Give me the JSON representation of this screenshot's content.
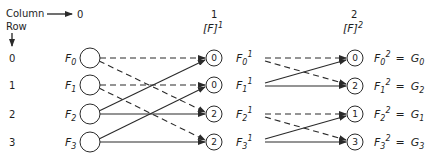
{
  "header": {
    "column_label": "Column",
    "row_label": "Row",
    "columns": [
      {
        "index": "0",
        "matrix": ""
      },
      {
        "index": "1",
        "matrix": "[F]",
        "matrix_sup": "1"
      },
      {
        "index": "2",
        "matrix": "[F]",
        "matrix_sup": "2"
      }
    ]
  },
  "rows": [
    "0",
    "1",
    "2",
    "3"
  ],
  "column0": {
    "labels": [
      {
        "base": "F",
        "sub": "0"
      },
      {
        "base": "F",
        "sub": "1"
      },
      {
        "base": "F",
        "sub": "2"
      },
      {
        "base": "F",
        "sub": "3"
      }
    ]
  },
  "column1": {
    "node_values": [
      "0",
      "0",
      "2",
      "2"
    ],
    "labels": [
      {
        "base": "F",
        "sub": "0",
        "sup": "1"
      },
      {
        "base": "F",
        "sub": "1",
        "sup": "1"
      },
      {
        "base": "F",
        "sub": "2",
        "sup": "1"
      },
      {
        "base": "F",
        "sub": "3",
        "sup": "1"
      }
    ]
  },
  "column2": {
    "node_values": [
      "0",
      "2",
      "1",
      "3"
    ],
    "labels": [
      {
        "base": "F",
        "sub": "0",
        "sup": "2",
        "eq": "=",
        "result": "G",
        "result_sub": "0"
      },
      {
        "base": "F",
        "sub": "1",
        "sup": "2",
        "eq": "=",
        "result": "G",
        "result_sub": "2"
      },
      {
        "base": "F",
        "sub": "2",
        "sup": "2",
        "eq": "=",
        "result": "G",
        "result_sub": "1"
      },
      {
        "base": "F",
        "sub": "3",
        "sup": "2",
        "eq": "=",
        "result": "G",
        "result_sub": "3"
      }
    ]
  },
  "edges": {
    "stage1": [
      {
        "from": 0,
        "to": 0,
        "style": "dashed"
      },
      {
        "from": 0,
        "to": 2,
        "style": "dashed"
      },
      {
        "from": 1,
        "to": 1,
        "style": "dashed"
      },
      {
        "from": 1,
        "to": 3,
        "style": "dashed"
      },
      {
        "from": 2,
        "to": 0,
        "style": "solid"
      },
      {
        "from": 2,
        "to": 2,
        "style": "solid"
      },
      {
        "from": 3,
        "to": 1,
        "style": "solid"
      },
      {
        "from": 3,
        "to": 3,
        "style": "solid"
      }
    ],
    "stage2": [
      {
        "from": 0,
        "to": 0,
        "style": "dashed"
      },
      {
        "from": 0,
        "to": 1,
        "style": "dashed"
      },
      {
        "from": 1,
        "to": 0,
        "style": "solid"
      },
      {
        "from": 1,
        "to": 1,
        "style": "solid"
      },
      {
        "from": 2,
        "to": 2,
        "style": "dashed"
      },
      {
        "from": 2,
        "to": 3,
        "style": "dashed"
      },
      {
        "from": 3,
        "to": 2,
        "style": "solid"
      },
      {
        "from": 3,
        "to": 3,
        "style": "solid"
      }
    ]
  }
}
